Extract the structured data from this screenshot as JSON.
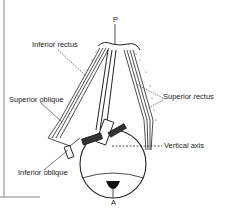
{
  "diagram": {
    "labels": {
      "apex": "P",
      "anterior": "A",
      "inferior_rectus": "Inferior rectus",
      "superior_rectus": "Superior rectus",
      "superior_oblique": "Superior oblique",
      "inferior_oblique": "Inferior oblique",
      "vertical_axis": "Vertical axis"
    },
    "colors": {
      "ink": "#222222",
      "background": "#ffffff"
    }
  }
}
